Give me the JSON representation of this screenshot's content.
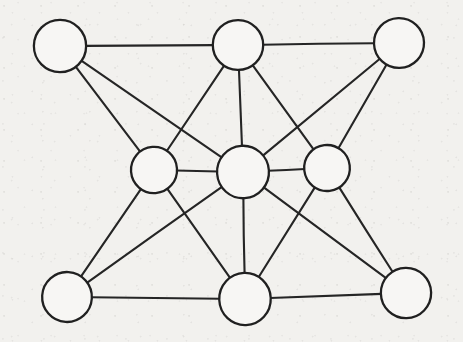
{
  "figure": {
    "medium": "pen on paper",
    "background_color": "#f2f1ee",
    "stroke_color": "#252525",
    "node_fill_color": "#f7f6f4",
    "width": 463,
    "height": 342
  },
  "chart_data": {
    "type": "diagram",
    "graph_type": "undirected",
    "node_count": 9,
    "edge_count": 18,
    "nodes": [
      {
        "id": "n1",
        "name": "top-left",
        "label": "",
        "x": 60,
        "y": 46,
        "r": 26,
        "degree": 3
      },
      {
        "id": "n2",
        "name": "top-center",
        "label": "",
        "x": 238,
        "y": 45,
        "r": 25,
        "degree": 5
      },
      {
        "id": "n3",
        "name": "top-right",
        "label": "",
        "x": 399,
        "y": 43,
        "r": 25,
        "degree": 3
      },
      {
        "id": "n4",
        "name": "middle-left",
        "label": "",
        "x": 154,
        "y": 170,
        "r": 23,
        "degree": 5
      },
      {
        "id": "n5",
        "name": "center",
        "label": "",
        "x": 243,
        "y": 172,
        "r": 26,
        "degree": 8
      },
      {
        "id": "n6",
        "name": "middle-right",
        "label": "",
        "x": 327,
        "y": 168,
        "r": 23,
        "degree": 4
      },
      {
        "id": "n7",
        "name": "bottom-left",
        "label": "",
        "x": 67,
        "y": 297,
        "r": 25,
        "degree": 3
      },
      {
        "id": "n8",
        "name": "bottom-center",
        "label": "",
        "x": 245,
        "y": 299,
        "r": 26,
        "degree": 5
      },
      {
        "id": "n9",
        "name": "bottom-right",
        "label": "",
        "x": 406,
        "y": 293,
        "r": 25,
        "degree": 3
      }
    ],
    "edges": [
      {
        "from": "n1",
        "to": "n2"
      },
      {
        "from": "n1",
        "to": "n4"
      },
      {
        "from": "n1",
        "to": "n5"
      },
      {
        "from": "n2",
        "to": "n3"
      },
      {
        "from": "n2",
        "to": "n4"
      },
      {
        "from": "n2",
        "to": "n5"
      },
      {
        "from": "n2",
        "to": "n6"
      },
      {
        "from": "n3",
        "to": "n5"
      },
      {
        "from": "n3",
        "to": "n6"
      },
      {
        "from": "n4",
        "to": "n5"
      },
      {
        "from": "n4",
        "to": "n7"
      },
      {
        "from": "n4",
        "to": "n8"
      },
      {
        "from": "n5",
        "to": "n6"
      },
      {
        "from": "n5",
        "to": "n7"
      },
      {
        "from": "n5",
        "to": "n8"
      },
      {
        "from": "n5",
        "to": "n9"
      },
      {
        "from": "n6",
        "to": "n8"
      },
      {
        "from": "n6",
        "to": "n9"
      },
      {
        "from": "n7",
        "to": "n8"
      },
      {
        "from": "n8",
        "to": "n9"
      }
    ]
  }
}
